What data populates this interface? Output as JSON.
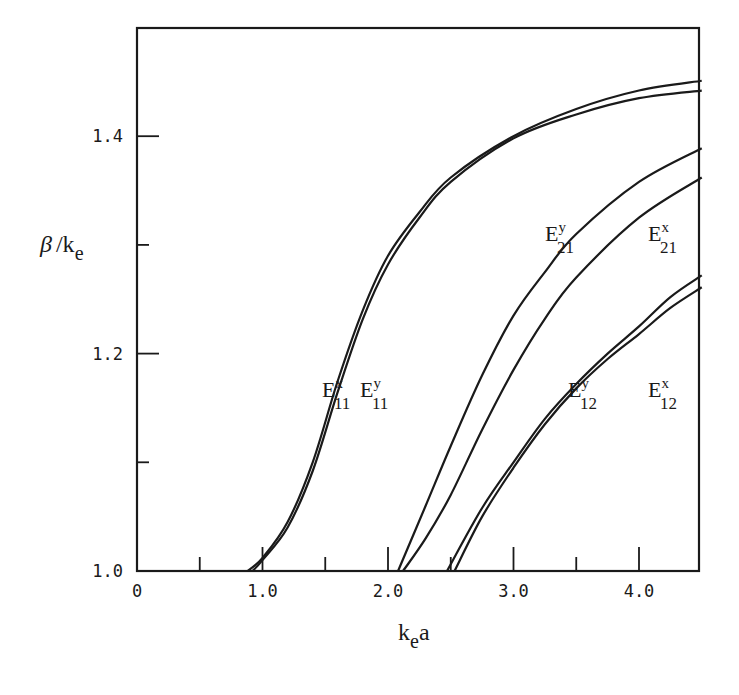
{
  "chart_data": {
    "type": "line",
    "title": "",
    "xlabel": "k_e a",
    "ylabel": "β / k_e",
    "xlim": [
      0,
      4.5
    ],
    "ylim": [
      1.0,
      1.5
    ],
    "grid": false,
    "legend": "inline curve labels",
    "x_ticks_major": [
      0,
      1.0,
      2.0,
      3.0,
      4.0
    ],
    "x_tick_labels": [
      "0",
      "1.0",
      "2.0",
      "3.0",
      "4.0"
    ],
    "x_ticks_minor": [
      0.5,
      1.5,
      2.5,
      3.5
    ],
    "y_ticks_major": [
      1.0,
      1.2,
      1.4
    ],
    "y_tick_labels": [
      "1.0",
      "1.2",
      "1.4"
    ],
    "y_ticks_minor": [
      1.1,
      1.3
    ],
    "series": [
      {
        "name": "E11^x",
        "label_main": "E",
        "sup": "x",
        "sub": "11",
        "points": [
          [
            0.88,
            1.0
          ],
          [
            1.0,
            1.012
          ],
          [
            1.2,
            1.045
          ],
          [
            1.4,
            1.1
          ],
          [
            1.6,
            1.175
          ],
          [
            1.8,
            1.24
          ],
          [
            2.0,
            1.29
          ],
          [
            2.25,
            1.33
          ],
          [
            2.5,
            1.362
          ],
          [
            3.0,
            1.4
          ],
          [
            3.5,
            1.425
          ],
          [
            4.0,
            1.442
          ],
          [
            4.5,
            1.451
          ]
        ]
      },
      {
        "name": "E11^y",
        "label_main": "E",
        "sup": "y",
        "sub": "11",
        "points": [
          [
            0.92,
            1.0
          ],
          [
            1.0,
            1.01
          ],
          [
            1.2,
            1.04
          ],
          [
            1.4,
            1.092
          ],
          [
            1.6,
            1.165
          ],
          [
            1.8,
            1.232
          ],
          [
            2.0,
            1.282
          ],
          [
            2.25,
            1.325
          ],
          [
            2.5,
            1.358
          ],
          [
            3.0,
            1.398
          ],
          [
            3.5,
            1.42
          ],
          [
            4.0,
            1.435
          ],
          [
            4.5,
            1.442
          ]
        ]
      },
      {
        "name": "E21^y",
        "label_main": "E",
        "sup": "y",
        "sub": "21",
        "points": [
          [
            2.08,
            1.0
          ],
          [
            2.3,
            1.06
          ],
          [
            2.5,
            1.115
          ],
          [
            2.75,
            1.18
          ],
          [
            3.0,
            1.235
          ],
          [
            3.25,
            1.275
          ],
          [
            3.5,
            1.31
          ],
          [
            4.0,
            1.358
          ],
          [
            4.5,
            1.389
          ]
        ]
      },
      {
        "name": "E21^x",
        "label_main": "E",
        "sup": "x",
        "sub": "21",
        "points": [
          [
            2.12,
            1.0
          ],
          [
            2.3,
            1.03
          ],
          [
            2.5,
            1.07
          ],
          [
            2.75,
            1.13
          ],
          [
            3.0,
            1.185
          ],
          [
            3.25,
            1.232
          ],
          [
            3.5,
            1.27
          ],
          [
            4.0,
            1.325
          ],
          [
            4.5,
            1.362
          ]
        ]
      },
      {
        "name": "E12^y",
        "label_main": "E",
        "sup": "y",
        "sub": "12",
        "points": [
          [
            2.47,
            1.0
          ],
          [
            2.75,
            1.058
          ],
          [
            3.0,
            1.1
          ],
          [
            3.25,
            1.14
          ],
          [
            3.5,
            1.172
          ],
          [
            3.75,
            1.2
          ],
          [
            4.0,
            1.225
          ],
          [
            4.25,
            1.252
          ],
          [
            4.5,
            1.272
          ]
        ]
      },
      {
        "name": "E12^x",
        "label_main": "E",
        "sup": "x",
        "sub": "12",
        "points": [
          [
            2.53,
            1.0
          ],
          [
            2.75,
            1.05
          ],
          [
            3.0,
            1.095
          ],
          [
            3.25,
            1.135
          ],
          [
            3.5,
            1.168
          ],
          [
            3.75,
            1.195
          ],
          [
            4.0,
            1.218
          ],
          [
            4.25,
            1.242
          ],
          [
            4.5,
            1.261
          ]
        ]
      }
    ],
    "annotations": [
      {
        "series": "E11^x",
        "x_px": 322,
        "y_px": 397
      },
      {
        "series": "E11^y",
        "x_px": 360,
        "y_px": 397
      },
      {
        "series": "E21^y",
        "x_px": 545,
        "y_px": 241
      },
      {
        "series": "E21^x",
        "x_px": 648,
        "y_px": 241
      },
      {
        "series": "E12^y",
        "x_px": 568,
        "y_px": 397
      },
      {
        "series": "E12^x",
        "x_px": 648,
        "y_px": 397
      }
    ]
  },
  "axis": {
    "ylabel_beta": "β",
    "ylabel_slash": "/k",
    "ylabel_sub": "e",
    "xlabel_k": "k",
    "xlabel_sub": "e",
    "xlabel_a": "a"
  },
  "style": {
    "line_color": "#1a1a1a",
    "background": "#ffffff"
  }
}
